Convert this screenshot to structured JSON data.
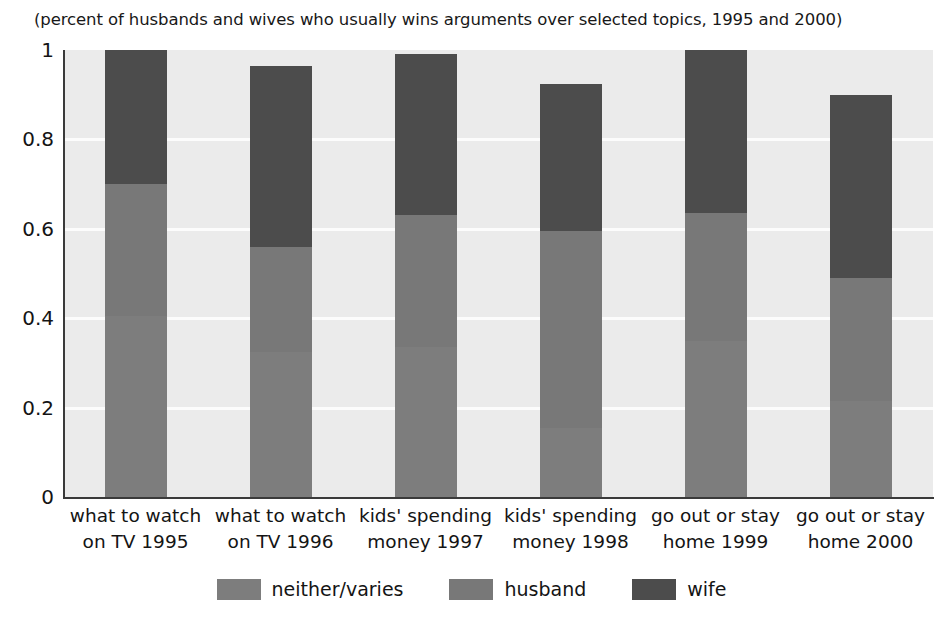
{
  "chart_data": {
    "type": "bar",
    "subtype": "stacked-vertical",
    "title": "(percent of husbands and wives who usually wins arguments over selected topics, 1995 and 2000)",
    "xlabel": "",
    "ylabel": "",
    "ylim": [
      0,
      1
    ],
    "yticks": [
      "0",
      "0.2",
      "0.4",
      "0.6",
      "0.8",
      "1"
    ],
    "ytick_values": [
      0,
      0.2,
      0.4,
      0.6,
      0.8,
      1
    ],
    "grid": "horizontal",
    "legend_position": "bottom-center",
    "categories": [
      "what to watch on TV 1995",
      "what to watch on TV 1996",
      "kids' spending money 1997",
      "kids' spending money 1998",
      "go out or stay home 1999",
      "go out or stay home 2000"
    ],
    "category_lines": [
      [
        "what to watch",
        "on TV 1995"
      ],
      [
        "what to watch",
        "on TV 1996"
      ],
      [
        "kids' spending",
        "money 1997"
      ],
      [
        "kids' spending",
        "money 1998"
      ],
      [
        "go out or stay",
        "home 1999"
      ],
      [
        "go out or stay",
        "home 2000"
      ]
    ],
    "series": [
      {
        "name": "neither/varies",
        "color": "#7d7d7d",
        "values": [
          0.405,
          0.325,
          0.335,
          0.155,
          0.35,
          0.215
        ]
      },
      {
        "name": "husband",
        "color": "#787878",
        "values": [
          0.295,
          0.235,
          0.295,
          0.44,
          0.285,
          0.275
        ]
      },
      {
        "name": "wife",
        "color": "#4c4c4c",
        "values": [
          0.3,
          0.405,
          0.36,
          0.33,
          0.365,
          0.41
        ]
      }
    ],
    "stack_tops": {
      "neither/varies": [
        0.405,
        0.325,
        0.335,
        0.155,
        0.35,
        0.215
      ],
      "husband": [
        0.7,
        0.56,
        0.63,
        0.595,
        0.635,
        0.49
      ],
      "wife": [
        1.0,
        0.965,
        0.99,
        0.925,
        1.0,
        0.9
      ]
    },
    "plot_background": "#ebebeb",
    "gridline_color": "#fcfcfc",
    "axis_color": "#3a3a3a"
  },
  "legend": {
    "items": [
      {
        "label": "neither/varies",
        "color": "#7d7d7d"
      },
      {
        "label": "husband",
        "color": "#787878"
      },
      {
        "label": "wife",
        "color": "#4c4c4c"
      }
    ]
  }
}
